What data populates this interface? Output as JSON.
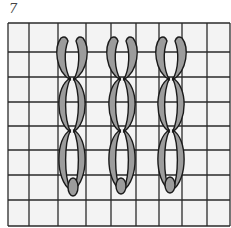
{
  "figure": {
    "number": "7"
  },
  "colors": {
    "grid_bg": "#f3f3f3",
    "grid_line": "#2a2a2a",
    "stitch_fill": "#9c9c9c",
    "stitch_stroke": "#1a1a1a"
  },
  "grid": {
    "x_lines": [
      8,
      29,
      58,
      86,
      111,
      136,
      159,
      182,
      207,
      230
    ],
    "y_lines": [
      23,
      52,
      77,
      102,
      126,
      150,
      175,
      200,
      226
    ]
  },
  "chains": [
    {
      "name": "chain-column-1",
      "cx": 72,
      "links": 3,
      "tie": {
        "cx": 73,
        "cy": 187,
        "rx": 5,
        "ry": 9
      }
    },
    {
      "name": "chain-column-2",
      "cx": 122,
      "links": 3,
      "tie": {
        "cx": 121,
        "cy": 186,
        "rx": 5,
        "ry": 8
      }
    },
    {
      "name": "chain-column-3",
      "cx": 171,
      "links": 3,
      "tie": {
        "cx": 170,
        "cy": 185,
        "rx": 5,
        "ry": 8
      }
    }
  ],
  "link_rows": [
    {
      "top": 37,
      "bottom": 80,
      "open_top": true
    },
    {
      "top": 78,
      "bottom": 132,
      "open_top": false
    },
    {
      "top": 130,
      "bottom": 190,
      "open_top": false
    }
  ]
}
